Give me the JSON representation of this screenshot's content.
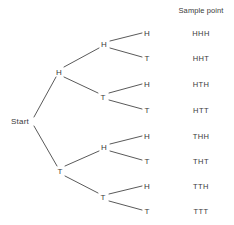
{
  "diagram": {
    "title": "",
    "background_color": "#ffffff",
    "line_color": "#5a5a5a",
    "text_color": "#3a3a3a",
    "root": {
      "label": "Start",
      "x": 20,
      "y": 121
    },
    "column_header": {
      "label": "Sample point",
      "x": 201,
      "y": 10
    },
    "nodes": [
      {
        "id": "h",
        "label": "H",
        "level": 1,
        "x": 59,
        "y": 72
      },
      {
        "id": "t",
        "label": "T",
        "level": 1,
        "x": 60,
        "y": 171
      },
      {
        "id": "hh",
        "label": "H",
        "level": 2,
        "x": 104,
        "y": 44
      },
      {
        "id": "ht",
        "label": "T",
        "level": 2,
        "x": 103,
        "y": 97
      },
      {
        "id": "th",
        "label": "H",
        "level": 2,
        "x": 104,
        "y": 147
      },
      {
        "id": "tt",
        "label": "T",
        "level": 2,
        "x": 103,
        "y": 197
      },
      {
        "id": "hhh",
        "label": "H",
        "level": 3,
        "x": 147,
        "y": 33
      },
      {
        "id": "hht",
        "label": "T",
        "level": 3,
        "x": 147,
        "y": 58
      },
      {
        "id": "hth",
        "label": "H",
        "level": 3,
        "x": 147,
        "y": 84
      },
      {
        "id": "htt",
        "label": "T",
        "level": 3,
        "x": 147,
        "y": 110
      },
      {
        "id": "thh",
        "label": "H",
        "level": 3,
        "x": 147,
        "y": 136
      },
      {
        "id": "tht",
        "label": "T",
        "level": 3,
        "x": 147,
        "y": 161
      },
      {
        "id": "tth",
        "label": "H",
        "level": 3,
        "x": 147,
        "y": 186
      },
      {
        "id": "ttt",
        "label": "T",
        "level": 3,
        "x": 147,
        "y": 211
      }
    ],
    "edges": [
      {
        "from": "start",
        "to": "h",
        "x1": 34,
        "y1": 117,
        "x2": 56,
        "y2": 77
      },
      {
        "from": "start",
        "to": "t",
        "x1": 34,
        "y1": 126,
        "x2": 57,
        "y2": 166
      },
      {
        "from": "h",
        "to": "hh",
        "x1": 64,
        "y1": 67,
        "x2": 99,
        "y2": 48
      },
      {
        "from": "h",
        "to": "ht",
        "x1": 64,
        "y1": 77,
        "x2": 98,
        "y2": 93
      },
      {
        "from": "t",
        "to": "th",
        "x1": 65,
        "y1": 166,
        "x2": 99,
        "y2": 151
      },
      {
        "from": "t",
        "to": "tt",
        "x1": 65,
        "y1": 176,
        "x2": 98,
        "y2": 193
      },
      {
        "from": "hh",
        "to": "hhh",
        "x1": 110,
        "y1": 41,
        "x2": 142,
        "y2": 33
      },
      {
        "from": "hh",
        "to": "hht",
        "x1": 110,
        "y1": 48,
        "x2": 142,
        "y2": 57
      },
      {
        "from": "ht",
        "to": "hth",
        "x1": 109,
        "y1": 93,
        "x2": 142,
        "y2": 84
      },
      {
        "from": "ht",
        "to": "htt",
        "x1": 109,
        "y1": 100,
        "x2": 142,
        "y2": 109
      },
      {
        "from": "th",
        "to": "thh",
        "x1": 110,
        "y1": 144,
        "x2": 142,
        "y2": 136
      },
      {
        "from": "th",
        "to": "tht",
        "x1": 110,
        "y1": 151,
        "x2": 142,
        "y2": 160
      },
      {
        "from": "tt",
        "to": "tth",
        "x1": 109,
        "y1": 194,
        "x2": 142,
        "y2": 186
      },
      {
        "from": "tt",
        "to": "ttt",
        "x1": 109,
        "y1": 201,
        "x2": 142,
        "y2": 210
      }
    ],
    "sample_points": [
      {
        "label": "HHH",
        "x": 201,
        "y": 33
      },
      {
        "label": "HHT",
        "x": 201,
        "y": 58
      },
      {
        "label": "HTH",
        "x": 201,
        "y": 84
      },
      {
        "label": "HTT",
        "x": 201,
        "y": 110
      },
      {
        "label": "THH",
        "x": 201,
        "y": 136
      },
      {
        "label": "THT",
        "x": 201,
        "y": 161
      },
      {
        "label": "TTH",
        "x": 201,
        "y": 186
      },
      {
        "label": "TTT",
        "x": 201,
        "y": 211
      }
    ]
  },
  "chart_data": {
    "type": "diagram",
    "subtype": "probability-tree",
    "title": "Sample point",
    "root_label": "Start",
    "levels": 3,
    "branch_labels": [
      "H",
      "T"
    ],
    "outcomes": [
      "HHH",
      "HHT",
      "HTH",
      "HTT",
      "THH",
      "THT",
      "TTH",
      "TTT"
    ],
    "outcome_count": 8,
    "paths": [
      [
        "Start",
        "H",
        "H",
        "H"
      ],
      [
        "Start",
        "H",
        "H",
        "T"
      ],
      [
        "Start",
        "H",
        "T",
        "H"
      ],
      [
        "Start",
        "H",
        "T",
        "T"
      ],
      [
        "Start",
        "T",
        "H",
        "H"
      ],
      [
        "Start",
        "T",
        "H",
        "T"
      ],
      [
        "Start",
        "T",
        "T",
        "H"
      ],
      [
        "Start",
        "T",
        "T",
        "T"
      ]
    ]
  }
}
